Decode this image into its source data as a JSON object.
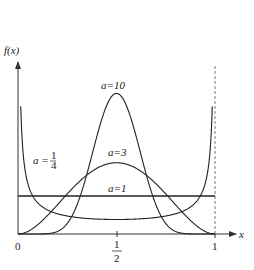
{
  "chart_data": {
    "type": "line",
    "title": "",
    "xlabel": "x",
    "ylabel": "f(x)",
    "xlim": [
      0,
      1
    ],
    "x_ticks": [
      "0",
      "1/2",
      "1"
    ],
    "grid": false,
    "legend": "inline labels",
    "series": [
      {
        "name": "a = 1/4",
        "a": 0.25,
        "shape": "U-shaped, diverges at 0 and 1, minimum ~0.64 at x=1/2"
      },
      {
        "name": "a=1",
        "a": 1,
        "shape": "constant 1"
      },
      {
        "name": "a=3",
        "a": 3,
        "shape": "bell, peak ~1.875 at x=1/2"
      },
      {
        "name": "a=10",
        "a": 10,
        "shape": "bell, peak ~3.5 at x=1/2"
      }
    ],
    "annotations": [
      "dashed vertical line at x=1"
    ]
  },
  "labels": {
    "ylabel": "f(x)",
    "xlabel": "x",
    "tick0": "0",
    "tick_half_num": "1",
    "tick_half_den": "2",
    "tick1": "1",
    "a10": "a=10",
    "a3": "a=3",
    "a1": "a=1",
    "aq_prefix": "a = ",
    "aq_num": "1",
    "aq_den": "4"
  }
}
